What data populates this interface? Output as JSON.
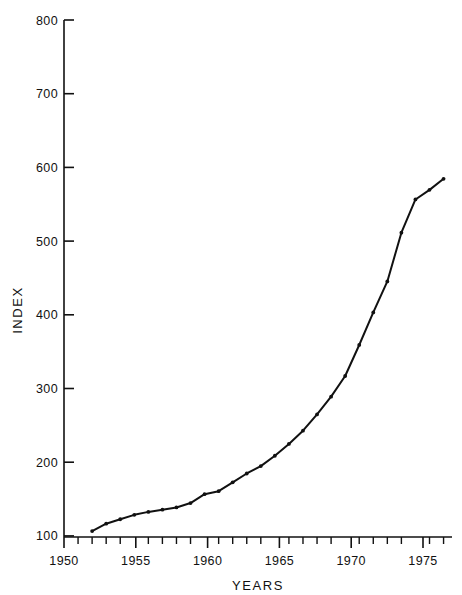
{
  "chart_data": {
    "type": "line",
    "title": "",
    "xlabel": "YEARS",
    "ylabel": "INDEX",
    "xlim": [
      1950,
      1977.6
    ],
    "ylim": [
      100,
      800
    ],
    "grid": false,
    "legend": "none",
    "line_color": "#111111",
    "marker": "dot",
    "x_major_ticks": [
      1950,
      1955,
      1960,
      1965,
      1970,
      1975
    ],
    "x_major_tick_labels": [
      "1950",
      "1955",
      "1960",
      "1965",
      "1970",
      "1975"
    ],
    "x_minor_tick_step": 1,
    "y_major_ticks": [
      100,
      200,
      300,
      400,
      500,
      600,
      700,
      800
    ],
    "y_major_tick_labels": [
      "100",
      "200",
      "300",
      "400",
      "500",
      "600",
      "700",
      "800"
    ],
    "series": [
      {
        "name": "Index",
        "x": [
          1952,
          1953,
          1954,
          1955,
          1956,
          1957,
          1958,
          1959,
          1960,
          1961,
          1962,
          1963,
          1964,
          1965,
          1966,
          1967,
          1968,
          1969,
          1970,
          1971,
          1972,
          1973,
          1974,
          1975,
          1976,
          1977
        ],
        "values": [
          108,
          118,
          124,
          130,
          134,
          137,
          140,
          146,
          158,
          162,
          174,
          186,
          196,
          210,
          226,
          244,
          266,
          290,
          318,
          360,
          404,
          446,
          512,
          557,
          570,
          585
        ]
      }
    ],
    "points": [
      {
        "year": 1952,
        "index": 108
      },
      {
        "year": 1953,
        "index": 118
      },
      {
        "year": 1954,
        "index": 124
      },
      {
        "year": 1955,
        "index": 130
      },
      {
        "year": 1956,
        "index": 134
      },
      {
        "year": 1957,
        "index": 137
      },
      {
        "year": 1958,
        "index": 140
      },
      {
        "year": 1959,
        "index": 146
      },
      {
        "year": 1960,
        "index": 158
      },
      {
        "year": 1961,
        "index": 162
      },
      {
        "year": 1962,
        "index": 174
      },
      {
        "year": 1963,
        "index": 186
      },
      {
        "year": 1964,
        "index": 196
      },
      {
        "year": 1965,
        "index": 210
      },
      {
        "year": 1966,
        "index": 226
      },
      {
        "year": 1967,
        "index": 244
      },
      {
        "year": 1968,
        "index": 266
      },
      {
        "year": 1969,
        "index": 290
      },
      {
        "year": 1970,
        "index": 318
      },
      {
        "year": 1971,
        "index": 360
      },
      {
        "year": 1972,
        "index": 404
      },
      {
        "year": 1973,
        "index": 446
      },
      {
        "year": 1974,
        "index": 512
      },
      {
        "year": 1975,
        "index": 557
      },
      {
        "year": 1976,
        "index": 585
      },
      {
        "year": 1977,
        "index": 690
      }
    ]
  }
}
